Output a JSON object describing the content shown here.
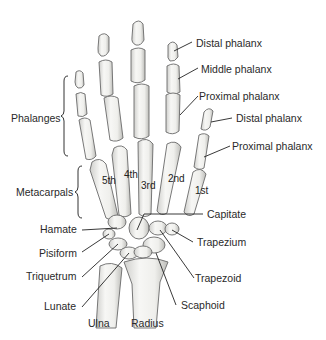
{
  "diagram": {
    "groups": [
      {
        "label": "Phalanges"
      },
      {
        "label": "Metacarpals"
      }
    ],
    "finger_labels": [
      {
        "label": "Distal phalanx"
      },
      {
        "label": "Middle phalanx"
      },
      {
        "label": "Proximal phalanx"
      }
    ],
    "thumb_labels": [
      {
        "label": "Distal phalanx"
      },
      {
        "label": "Proximal phalanx"
      }
    ],
    "metacarpal_numbers": [
      "5th",
      "4th",
      "3rd",
      "2nd",
      "1st"
    ],
    "carpal_labels_left": [
      {
        "label": "Hamate"
      },
      {
        "label": "Pisiform"
      },
      {
        "label": "Triquetrum"
      },
      {
        "label": "Lunate"
      }
    ],
    "carpal_labels_right": [
      {
        "label": "Capitate"
      },
      {
        "label": "Trapezium"
      },
      {
        "label": "Trapezoid"
      },
      {
        "label": "Scaphoid"
      }
    ],
    "forearm_labels": [
      {
        "label": "Ulna"
      },
      {
        "label": "Radius"
      }
    ],
    "colors": {
      "bone_fill": "#f2f2f0",
      "bone_shade": "#c9c9c6",
      "outline": "#6a6a6a",
      "leader": "#222222",
      "text": "#2a2a2a"
    }
  }
}
